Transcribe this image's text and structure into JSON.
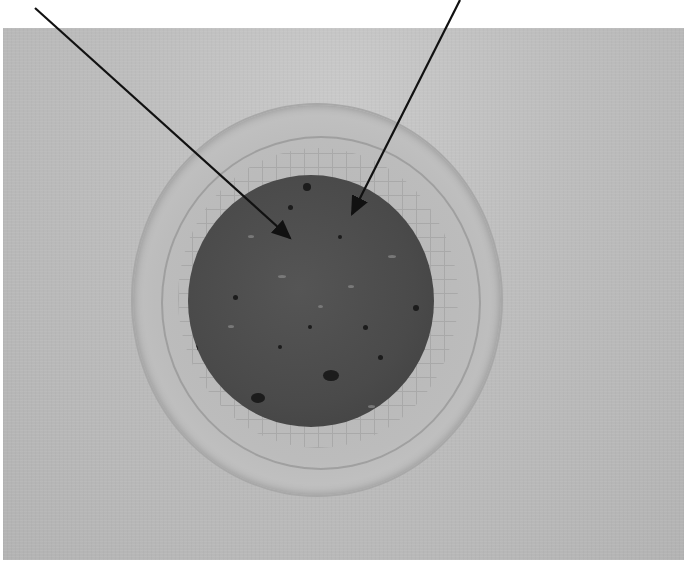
{
  "figure": {
    "type": "photograph",
    "arrow_count": 2,
    "colors": {
      "background": "#ffffff",
      "photo_bg": "#bdbdbd",
      "sample": "#4a4a4a",
      "arrow": "#111111"
    }
  }
}
